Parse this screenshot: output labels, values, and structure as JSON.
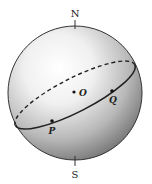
{
  "diagram": {
    "type": "sphere-great-circle",
    "labels": {
      "north": "N",
      "south": "S",
      "center": "O",
      "point_p": "P",
      "point_q": "Q"
    },
    "colors": {
      "outline": "#222222",
      "shade_dark": "#6e6e6e",
      "shade_light": "#ffffff",
      "background": "#ffffff"
    }
  }
}
